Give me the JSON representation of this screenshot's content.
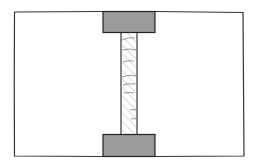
{
  "diagram": {
    "frame": {
      "stroke": "#333333",
      "fill": "#ffffff"
    },
    "top_grip": {
      "fill": "#9a9a9a",
      "stroke": "#222222"
    },
    "bottom_grip": {
      "fill": "#9a9a9a",
      "stroke": "#222222"
    },
    "specimen": {
      "fill": "#ffffff",
      "stroke": "#222222",
      "hatch_color": "#9a9a9a",
      "pattern": "diagonal-hatch"
    },
    "text_labels": []
  }
}
